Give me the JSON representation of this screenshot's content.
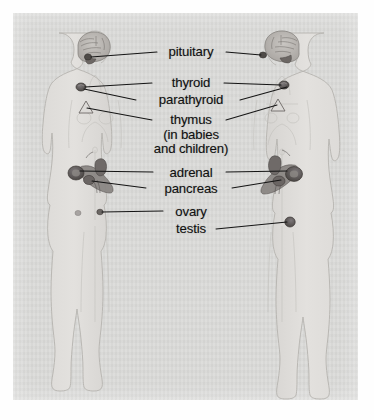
{
  "diagram": {
    "panel": {
      "background_color": "#d9d9d7",
      "page_color": "#fefefe"
    },
    "figures": [
      {
        "name": "female-figure",
        "side": "left",
        "label": "female body outline"
      },
      {
        "name": "male-figure",
        "side": "right",
        "label": "male body outline"
      }
    ],
    "labels": [
      {
        "id": "pituitary",
        "text": "pituitary",
        "x": 191,
        "y": 52,
        "leader_left": true,
        "leader_right": true
      },
      {
        "id": "thyroid",
        "text": "thyroid",
        "x": 191,
        "y": 83,
        "leader_left": true,
        "leader_right": true
      },
      {
        "id": "parathyroid",
        "text": "parathyroid",
        "x": 191,
        "y": 100,
        "leader_left": true,
        "leader_right": true
      },
      {
        "id": "thymus",
        "text": "thymus",
        "x": 191,
        "y": 121,
        "leader_left": true,
        "leader_right": true
      },
      {
        "id": "thymus-note-1",
        "text": "(in babies",
        "x": 191,
        "y": 135,
        "leader_left": false,
        "leader_right": false
      },
      {
        "id": "thymus-note-2",
        "text": "and children)",
        "x": 191,
        "y": 149,
        "leader_left": false,
        "leader_right": false
      },
      {
        "id": "adrenal",
        "text": "adrenal",
        "x": 191,
        "y": 173,
        "leader_left": true,
        "leader_right": true
      },
      {
        "id": "pancreas",
        "text": "pancreas",
        "x": 191,
        "y": 189,
        "leader_left": true,
        "leader_right": true
      },
      {
        "id": "ovary",
        "text": "ovary",
        "x": 191,
        "y": 212,
        "leader_left": true,
        "leader_right": false
      },
      {
        "id": "testis",
        "text": "testis",
        "x": 191,
        "y": 229,
        "leader_left": false,
        "leader_right": true
      }
    ],
    "organ_markers": [
      {
        "id": "pituitary-left",
        "organ": "pituitary",
        "x": 88,
        "y": 57
      },
      {
        "id": "pituitary-right",
        "organ": "pituitary",
        "x": 263,
        "y": 55
      },
      {
        "id": "thyroid-left",
        "organ": "thyroid",
        "x": 81,
        "y": 87
      },
      {
        "id": "thyroid-right",
        "organ": "thyroid",
        "x": 284,
        "y": 85
      },
      {
        "id": "thymus-left",
        "organ": "thymus",
        "x": 86,
        "y": 108
      },
      {
        "id": "thymus-right",
        "organ": "thymus",
        "x": 278,
        "y": 105
      },
      {
        "id": "adrenal-left",
        "organ": "adrenal",
        "x": 76,
        "y": 173
      },
      {
        "id": "adrenal-right",
        "organ": "adrenal",
        "x": 285,
        "y": 172
      },
      {
        "id": "pancreas-left",
        "organ": "pancreas",
        "x": 92,
        "y": 182
      },
      {
        "id": "pancreas-right",
        "organ": "pancreas",
        "x": 279,
        "y": 181
      },
      {
        "id": "ovary-left",
        "organ": "ovary",
        "x": 100,
        "y": 212
      },
      {
        "id": "testis-right",
        "organ": "testis",
        "x": 290,
        "y": 222
      }
    ],
    "colors": {
      "label_text": "#111111",
      "leader_line": "#1a1a1a",
      "organ_marker": "#555153",
      "body_outline": "#b9b9b6",
      "body_fill": "#dedcda"
    }
  }
}
